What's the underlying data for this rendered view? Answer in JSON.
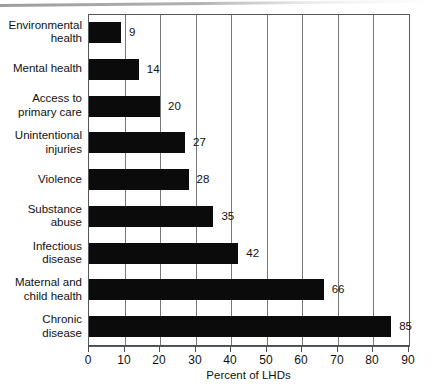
{
  "chart_data": {
    "type": "bar",
    "orientation": "horizontal",
    "title": "",
    "xlabel": "Percent of LHDs",
    "ylabel": "",
    "xlim": [
      0,
      90
    ],
    "xticks": [
      0,
      10,
      20,
      30,
      40,
      50,
      60,
      70,
      80,
      90
    ],
    "grid": "vertical",
    "legend": "none",
    "bar_color": "#0b0b0b",
    "categories": [
      "Environmental\nhealth",
      "Mental health",
      "Access to\nprimary care",
      "Unintentional\ninjuries",
      "Violence",
      "Substance\nabuse",
      "Infectious\ndisease",
      "Maternal and\nchild health",
      "Chronic\ndisease"
    ],
    "values": [
      9,
      14,
      20,
      27,
      28,
      35,
      42,
      66,
      85
    ],
    "data_labels": [
      "9",
      "14",
      "20",
      "27",
      "28",
      "35",
      "42",
      "66",
      "85"
    ],
    "tick_labels": [
      "0",
      "10",
      "20",
      "30",
      "40",
      "50",
      "60",
      "70",
      "80",
      "90"
    ]
  }
}
